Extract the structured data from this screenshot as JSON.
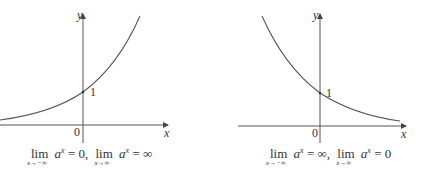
{
  "graphs": [
    {
      "id": "growth",
      "axis_x_label": "x",
      "axis_y_label": "y",
      "origin_label": "0",
      "intercept_label": "1",
      "caption": {
        "lim1_word": "lim",
        "lim1_sub": "x→−∞",
        "expr1": "a",
        "exp1": "x",
        "val1": " = 0,",
        "lim2_word": "lim",
        "lim2_sub": "x→∞",
        "expr2": "a",
        "exp2": "x",
        "val2": " = ∞"
      }
    },
    {
      "id": "decay",
      "axis_x_label": "x",
      "axis_y_label": "y",
      "origin_label": "0",
      "intercept_label": "1",
      "caption": {
        "lim1_word": "lim",
        "lim1_sub": "x→−∞",
        "expr1": "a",
        "exp1": "x",
        "val1": " = ∞,",
        "lim2_word": "lim",
        "lim2_sub": "x→∞",
        "expr2": "a",
        "exp2": "x",
        "val2": " = 0"
      }
    }
  ]
}
